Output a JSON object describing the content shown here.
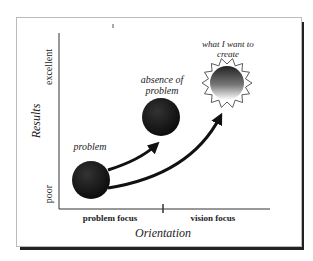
{
  "axes": {
    "y_title": "Results",
    "y_low": "poor",
    "y_high": "excellent",
    "x_title": "Orientation",
    "x_left": "problem focus",
    "x_right": "vision focus"
  },
  "nodes": {
    "problem": "problem",
    "absence_line1": "absence of",
    "absence_line2": "problem",
    "create_line1": "what I want to",
    "create_line2": "create"
  }
}
